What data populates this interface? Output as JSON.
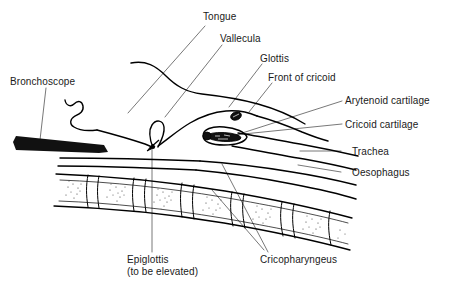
{
  "figure": {
    "kind": "anatomical-line-diagram",
    "background_color": "#ffffff",
    "ink_color": "#000000",
    "leader_line_color": "#555555",
    "text_color": "#1a1a1a"
  },
  "labels": {
    "tongue": "Tongue",
    "vallecula": "Vallecula",
    "glottis": "Glottis",
    "front_of_cricoid": "Front of cricoid",
    "bronchoscope": "Bronchoscope",
    "arytenoid_cartilage": "Arytenoid cartilage",
    "cricoid_cartilage": "Cricoid cartilage",
    "trachea": "Trachea",
    "oesophagus": "Oesophagus",
    "epiglottis_line1": "Epiglottis",
    "epiglottis_line2": "(to be elevated)",
    "cricopharyngeus": "Cricopharyngeus"
  },
  "structures": {
    "bronchoscope_fill": "#111111",
    "arytenoid_fill": "#111111",
    "cricoid_fill": "#111111",
    "vertebra_count": 6,
    "stipple_note": "cancellous bone stipple inside vertebral bodies"
  }
}
